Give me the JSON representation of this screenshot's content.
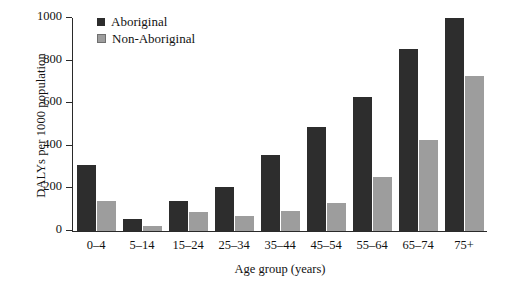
{
  "chart_data": {
    "type": "bar",
    "title": "",
    "xlabel": "Age group (years)",
    "ylabel": "DALYs per 1000 population",
    "ylim": [
      0,
      1000
    ],
    "yticks": [
      0,
      200,
      400,
      600,
      800,
      1000
    ],
    "grid": false,
    "legend_position": "top-left",
    "categories": [
      "0–4",
      "5–14",
      "15–24",
      "25–34",
      "35–44",
      "45–54",
      "55–64",
      "65–74",
      "75+"
    ],
    "series": [
      {
        "name": "Aboriginal",
        "color": "#2d2d2d",
        "values": [
          310,
          55,
          140,
          205,
          355,
          490,
          630,
          855,
          1000
        ]
      },
      {
        "name": "Non-Aboriginal",
        "color": "#9d9d9d",
        "values": [
          140,
          25,
          90,
          70,
          95,
          130,
          255,
          425,
          730
        ]
      }
    ]
  }
}
